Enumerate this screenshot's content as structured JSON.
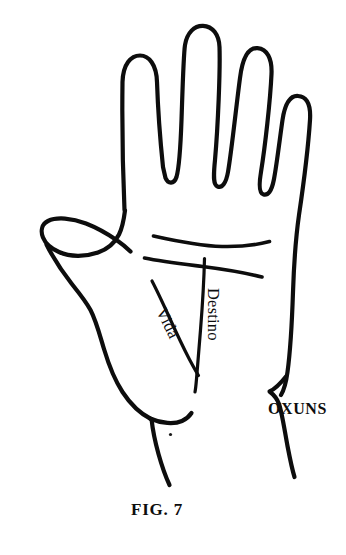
{
  "figure": {
    "caption": "FIG. 7",
    "brand_label": "OXUNS",
    "line_labels": {
      "life": "Vida",
      "fate": "Destino"
    },
    "colors": {
      "ink": "#0d0d0d",
      "background": "#ffffff"
    }
  }
}
